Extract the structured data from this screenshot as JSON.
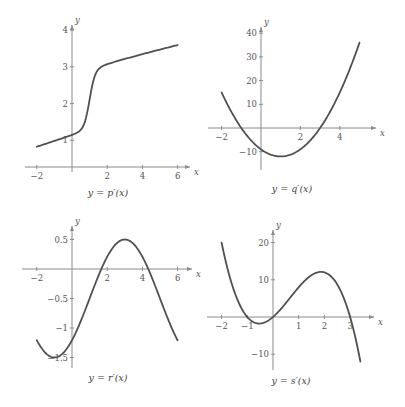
{
  "chart_data": [
    {
      "type": "line",
      "title": "y = p′(x)",
      "xlabel": "x",
      "ylabel": "y",
      "x_ticks": [
        -2,
        2,
        4,
        6
      ],
      "y_ticks": [
        1,
        2,
        3,
        4
      ],
      "xlim": [
        -2.5,
        6.8
      ],
      "ylim": [
        0.27,
        4.1
      ],
      "x": [
        -2,
        -1,
        0,
        0.5,
        0.8,
        1,
        1.2,
        1.5,
        2,
        3,
        4,
        5,
        6
      ],
      "y": [
        0.55,
        0.78,
        1.0,
        1.25,
        1.6,
        2.0,
        2.4,
        2.72,
        2.98,
        3.25,
        3.43,
        3.57,
        3.7
      ],
      "grid": false
    },
    {
      "type": "line",
      "title": "y = q′(x)",
      "xlabel": "x",
      "ylabel": "y",
      "x_ticks": [
        -2,
        2,
        4
      ],
      "y_ticks": [
        40,
        30,
        20,
        10,
        -10
      ],
      "xlim": [
        -2.5,
        5.6
      ],
      "ylim": [
        -17,
        42
      ],
      "formula": "3(x+1)(x-3)",
      "x": [
        -2,
        -1,
        0,
        1,
        2,
        3,
        4,
        5
      ],
      "y": [
        15,
        0,
        -9,
        -12,
        -9,
        0,
        15,
        36
      ],
      "grid": false
    },
    {
      "type": "line",
      "title": "y = r′(x)",
      "xlabel": "x",
      "ylabel": "y",
      "x_ticks": [
        -2,
        2,
        4,
        6
      ],
      "y_ticks": [
        0.5,
        -0.5,
        -1,
        -1.5
      ],
      "xlim": [
        -2.5,
        6.8
      ],
      "ylim": [
        -1.6,
        0.65
      ],
      "formula": "-0.5 + cos((x-3)π/4)",
      "x": [
        -2,
        -1,
        0,
        1,
        1.67,
        2,
        3,
        4,
        4.33,
        5,
        6
      ],
      "y": [
        -1.21,
        -1.5,
        -1.21,
        -0.5,
        0,
        0.21,
        0.5,
        0.21,
        0,
        -0.5,
        -1.21
      ],
      "grid": false
    },
    {
      "type": "line",
      "title": "y = s′(x)",
      "xlabel": "x",
      "ylabel": "y",
      "x_ticks": [
        -2,
        -1,
        1,
        2,
        3
      ],
      "y_ticks": [
        20,
        10,
        -10
      ],
      "xlim": [
        -2.3,
        3.9
      ],
      "ylim": [
        -14,
        23
      ],
      "formula": "-2x(x+1)(x-3)",
      "x": [
        -2,
        -1,
        -0.5,
        0,
        1,
        2,
        3,
        3.4
      ],
      "y": [
        20,
        0,
        -1.75,
        0,
        8,
        12,
        0,
        -12
      ],
      "grid": false
    }
  ],
  "plots": [
    {
      "caption": "y = p′(x)",
      "x_axis_label": "x",
      "y_axis_label": "y",
      "ox": 72,
      "oy_px_for_zero": 177,
      "axis_y_px": 167,
      "sx": 17.6,
      "sy": 36.7,
      "x_axis_range_px": [
        25,
        190
      ],
      "y_axis_range_px": [
        25,
        172
      ],
      "x_ticks": [
        {
          "v": -2,
          "label": "−2"
        },
        {
          "v": 2,
          "label": "2"
        },
        {
          "v": 4,
          "label": "4"
        },
        {
          "v": 6,
          "label": "6"
        }
      ],
      "y_ticks": [
        {
          "v": 1,
          "label": "1"
        },
        {
          "v": 2,
          "label": "2"
        },
        {
          "v": 3,
          "label": "3"
        },
        {
          "v": 4,
          "label": "4"
        }
      ],
      "fn": "p",
      "domain": [
        -2,
        6
      ],
      "caption_pos": [
        108,
        196
      ]
    },
    {
      "caption": "y = q′(x)",
      "x_axis_label": "x",
      "y_axis_label": "y",
      "ox": 261,
      "oy_px_for_zero": 128,
      "axis_y_px": 128,
      "sx": 19.7,
      "sy": 2.37,
      "x_axis_range_px": [
        208,
        376
      ],
      "y_axis_range_px": [
        27,
        170
      ],
      "x_ticks": [
        {
          "v": -2,
          "label": "−2"
        },
        {
          "v": 2,
          "label": "2"
        },
        {
          "v": 4,
          "label": "4"
        }
      ],
      "y_ticks": [
        {
          "v": 40,
          "label": "40"
        },
        {
          "v": 30,
          "label": "30"
        },
        {
          "v": 20,
          "label": "20"
        },
        {
          "v": 10,
          "label": "10"
        },
        {
          "v": -10,
          "label": "−10"
        }
      ],
      "fn": "q",
      "domain": [
        -2,
        5
      ],
      "caption_pos": [
        292,
        192
      ]
    },
    {
      "caption": "y = r′(x)",
      "x_axis_label": "x",
      "y_axis_label": "y",
      "ox": 72,
      "oy_px_for_zero": 269,
      "axis_y_px": 269,
      "sx": 17.6,
      "sy": 59,
      "x_axis_range_px": [
        22,
        192
      ],
      "y_axis_range_px": [
        226,
        368
      ],
      "x_ticks": [
        {
          "v": -2,
          "label": "−2"
        },
        {
          "v": 2,
          "label": "2"
        },
        {
          "v": 4,
          "label": "4"
        },
        {
          "v": 6,
          "label": "6"
        }
      ],
      "y_ticks": [
        {
          "v": 0.5,
          "label": "0.5"
        },
        {
          "v": -0.5,
          "label": "−0.5"
        },
        {
          "v": -1,
          "label": "−1"
        },
        {
          "v": -1.5,
          "label": "−1.5"
        }
      ],
      "fn": "r",
      "domain": [
        -2,
        6
      ],
      "caption_pos": [
        108,
        381
      ]
    },
    {
      "caption": "y = s′(x)",
      "x_axis_label": "x",
      "y_axis_label": "y",
      "ox": 273,
      "oy_px_for_zero": 317,
      "axis_y_px": 317,
      "sx": 25.7,
      "sy": 3.72,
      "x_axis_range_px": [
        207,
        374
      ],
      "y_axis_range_px": [
        230,
        370
      ],
      "x_ticks": [
        {
          "v": -2,
          "label": "−2"
        },
        {
          "v": -1,
          "label": "−1"
        },
        {
          "v": 1,
          "label": "1"
        },
        {
          "v": 2,
          "label": "2"
        },
        {
          "v": 3,
          "label": "3"
        }
      ],
      "y_ticks": [
        {
          "v": 20,
          "label": "20"
        },
        {
          "v": 10,
          "label": "10"
        },
        {
          "v": -10,
          "label": "−10"
        }
      ],
      "fn": "s",
      "domain": [
        -2,
        3.4
      ],
      "caption_pos": [
        291,
        384
      ]
    }
  ],
  "colors": {
    "axis": "#8a8a8a",
    "curve": "#505050",
    "text": "#555555"
  }
}
